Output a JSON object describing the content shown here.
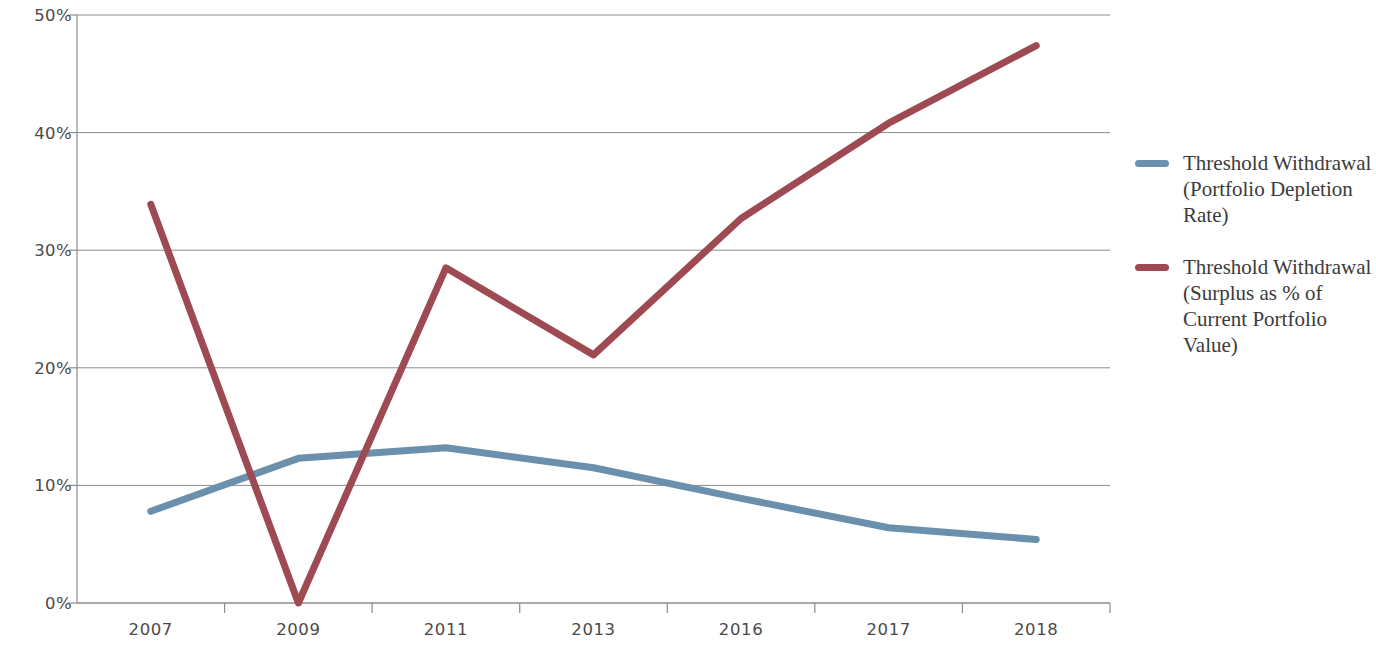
{
  "chart_data": {
    "type": "line",
    "title": "",
    "subtitle": "",
    "xlabel": "",
    "ylabel": "",
    "categories": [
      "2007",
      "2009",
      "2011",
      "2013",
      "2016",
      "2017",
      "2018"
    ],
    "ylim": [
      0,
      50
    ],
    "yticks": [
      0,
      10,
      20,
      30,
      40,
      50
    ],
    "ytick_labels": [
      "0%",
      "10%",
      "20%",
      "30%",
      "40%",
      "50%"
    ],
    "grid": "horizontal",
    "legend_position": "right",
    "series": [
      {
        "name": "Threshold Withdrawal (Portfolio Depletion Rate)",
        "color": "#6b90ad",
        "values": [
          7.8,
          12.3,
          13.2,
          11.5,
          8.9,
          6.4,
          5.4
        ]
      },
      {
        "name": "Threshold Withdrawal (Surplus as % of Current Portfolio Value)",
        "color": "#9e4a52",
        "values": [
          33.9,
          0.0,
          28.5,
          21.1,
          32.7,
          40.8,
          47.4
        ]
      }
    ]
  },
  "axes": {
    "y_labels": [
      "50%",
      "40%",
      "30%",
      "20%",
      "10%",
      "0%"
    ],
    "x_labels": [
      "2007",
      "2009",
      "2011",
      "2013",
      "2016",
      "2017",
      "2018"
    ]
  },
  "legend": {
    "items": [
      {
        "label": "Threshold Withdrawal (Portfolio Depletion Rate)",
        "color": "#6b90ad"
      },
      {
        "label": "Threshold Withdrawal (Surplus as % of Current Portfolio Value)",
        "color": "#9e4a52"
      }
    ]
  }
}
